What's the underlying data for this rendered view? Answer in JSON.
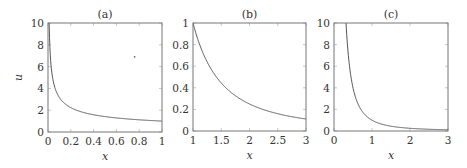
{
  "chart_data": [
    {
      "type": "line",
      "title": "(a)",
      "xlabel": "x",
      "ylabel": "u",
      "xlim": [
        0,
        1
      ],
      "ylim": [
        0,
        10
      ],
      "xticks": [
        "0",
        "0.2",
        "0.4",
        "0.6",
        "0.8",
        "1"
      ],
      "yticks": [
        "0",
        "2",
        "4",
        "6",
        "8",
        "10"
      ],
      "grid": false,
      "series": [
        {
          "name": "u(x)",
          "formula": "1/sqrt(x)",
          "x": [
            0.01,
            0.02,
            0.05,
            0.1,
            0.2,
            0.3,
            0.4,
            0.5,
            0.6,
            0.7,
            0.8,
            0.9,
            1.0
          ],
          "y": [
            10,
            7.07,
            4.47,
            3.16,
            2.24,
            1.83,
            1.58,
            1.41,
            1.29,
            1.2,
            1.12,
            1.05,
            1.0
          ]
        }
      ],
      "annotations": [
        {
          "type": "point",
          "x": 0.76,
          "y": 6.9
        }
      ]
    },
    {
      "type": "line",
      "title": "(b)",
      "xlabel": "x",
      "ylabel": "",
      "xlim": [
        1,
        3
      ],
      "ylim": [
        0,
        1
      ],
      "xticks": [
        "1",
        "1.5",
        "2",
        "2.5",
        "3"
      ],
      "yticks": [
        "0",
        "0.2",
        "0.4",
        "0.6",
        "0.8",
        "1"
      ],
      "grid": false,
      "series": [
        {
          "name": "u(x)",
          "formula": "1/x^2",
          "x": [
            1,
            1.25,
            1.5,
            1.75,
            2,
            2.25,
            2.5,
            2.75,
            3
          ],
          "y": [
            1,
            0.64,
            0.444,
            0.327,
            0.25,
            0.198,
            0.16,
            0.132,
            0.111
          ]
        }
      ]
    },
    {
      "type": "line",
      "title": "(c)",
      "xlabel": "x",
      "ylabel": "",
      "xlim": [
        0,
        3
      ],
      "ylim": [
        0,
        10
      ],
      "xticks": [
        "0",
        "1",
        "2",
        "3"
      ],
      "yticks": [
        "0",
        "2",
        "4",
        "6",
        "8",
        "10"
      ],
      "grid": false,
      "series": [
        {
          "name": "u(x)",
          "formula": "1/x^2",
          "x": [
            0.316,
            0.4,
            0.5,
            0.75,
            1,
            1.5,
            2,
            2.5,
            3
          ],
          "y": [
            10,
            6.25,
            4,
            1.78,
            1,
            0.444,
            0.25,
            0.16,
            0.111
          ]
        }
      ]
    }
  ]
}
